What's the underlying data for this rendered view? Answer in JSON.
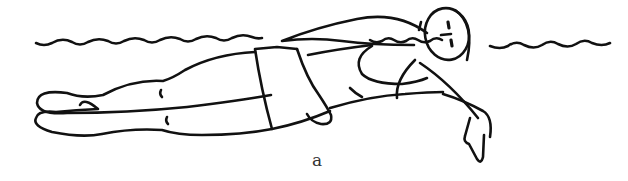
{
  "figure": {
    "caption": "a",
    "line_color": "#111111",
    "background": "#ffffff"
  }
}
